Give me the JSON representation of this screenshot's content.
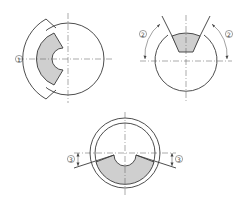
{
  "diagram": {
    "colors": {
      "outline": "#3a3a3a",
      "shade": "#cfcfcf",
      "background": "#ffffff"
    },
    "views": [
      {
        "id": "view-1",
        "label": "①",
        "description": "circle with left arc segment cut and shaded region with V notch"
      },
      {
        "id": "view-2",
        "label_left": "②",
        "label_right": "②",
        "description": "circle with V-shaped top cut, shaded trapezoid, angle arrows"
      },
      {
        "id": "view-3",
        "label_left": "③",
        "label_right": "③",
        "description": "double circle (ring) with lower shaded segment and semicircular notch, offset dimensions"
      }
    ]
  }
}
